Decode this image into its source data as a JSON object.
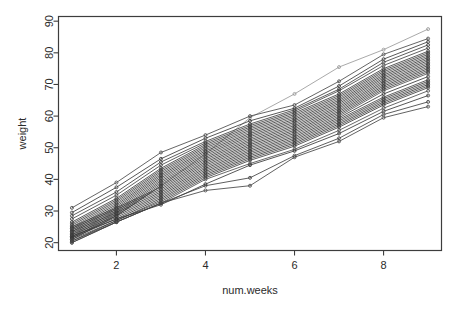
{
  "chart_data": {
    "type": "line",
    "title": "",
    "subtitle": "",
    "xlabel": "num.weeks",
    "ylabel": "weight",
    "xlim": [
      1,
      9
    ],
    "ylim": [
      19,
      90
    ],
    "xticks": [
      2,
      4,
      6,
      8
    ],
    "xticklabels": [
      "2",
      "4",
      "6",
      "8"
    ],
    "yticks": [
      20,
      30,
      40,
      50,
      60,
      70,
      80,
      90
    ],
    "yticklabels": [
      "20",
      "30",
      "40",
      "50",
      "60",
      "70",
      "80",
      "90"
    ],
    "grid": false,
    "legend": false,
    "legend_position": "none",
    "marker": "open-circle",
    "marker_size": 3,
    "line_color": "#333333",
    "background_color": "#ffffff",
    "frame_color": "#3d3d3d",
    "x": [
      1,
      2,
      3,
      4,
      5,
      6,
      7,
      8,
      9
    ],
    "n_series": 31,
    "series": [
      {
        "name": "subject-01",
        "color": "#9a9a9a",
        "values": [
          21.5,
          28.5,
          38.0,
          48.0,
          59.5,
          67.0,
          75.5,
          81.0,
          87.5
        ]
      },
      {
        "name": "subject-02",
        "color": "#4a4a4a",
        "values": [
          31.0,
          39.0,
          48.5,
          54.0,
          60.0,
          63.5,
          71.0,
          79.5,
          84.5
        ]
      },
      {
        "name": "subject-03",
        "color": "#3a3a3a",
        "values": [
          29.5,
          37.5,
          46.5,
          53.0,
          58.5,
          62.5,
          69.5,
          78.0,
          83.5
        ]
      },
      {
        "name": "subject-04",
        "color": "#404040",
        "values": [
          28.5,
          36.0,
          45.5,
          52.0,
          57.5,
          62.0,
          68.5,
          77.0,
          82.5
        ]
      },
      {
        "name": "subject-05",
        "color": "#454545",
        "values": [
          27.5,
          35.0,
          44.5,
          51.5,
          57.0,
          61.5,
          68.0,
          76.0,
          81.5
        ]
      },
      {
        "name": "subject-06",
        "color": "#3c3c3c",
        "values": [
          26.5,
          34.0,
          43.5,
          51.0,
          56.5,
          61.0,
          67.0,
          75.0,
          80.5
        ]
      },
      {
        "name": "subject-07",
        "color": "#484848",
        "values": [
          26.0,
          33.5,
          43.0,
          50.5,
          56.0,
          60.5,
          66.5,
          74.5,
          80.0
        ]
      },
      {
        "name": "subject-08",
        "color": "#3e3e3e",
        "values": [
          25.5,
          33.0,
          42.5,
          50.0,
          55.5,
          60.0,
          66.0,
          74.0,
          79.5
        ]
      },
      {
        "name": "subject-09",
        "color": "#525252",
        "values": [
          25.0,
          32.5,
          42.0,
          49.5,
          55.0,
          59.5,
          65.5,
          73.5,
          79.0
        ]
      },
      {
        "name": "subject-10",
        "color": "#383838",
        "values": [
          24.5,
          32.0,
          41.5,
          49.0,
          54.5,
          59.0,
          65.0,
          73.0,
          78.5
        ]
      },
      {
        "name": "subject-11",
        "color": "#464646",
        "values": [
          24.0,
          31.5,
          41.0,
          48.5,
          54.0,
          58.5,
          64.5,
          72.5,
          78.0
        ]
      },
      {
        "name": "subject-12",
        "color": "#3b3b3b",
        "values": [
          23.5,
          31.0,
          40.5,
          48.0,
          53.5,
          58.0,
          64.0,
          72.0,
          77.5
        ]
      },
      {
        "name": "subject-13",
        "color": "#505050",
        "values": [
          23.0,
          30.5,
          40.0,
          47.5,
          53.0,
          57.5,
          63.5,
          71.5,
          77.0
        ]
      },
      {
        "name": "subject-14",
        "color": "#404040",
        "values": [
          22.5,
          30.0,
          39.5,
          47.0,
          52.5,
          57.0,
          63.0,
          71.0,
          76.5
        ]
      },
      {
        "name": "subject-15",
        "color": "#3d3d3d",
        "values": [
          22.0,
          29.5,
          39.0,
          46.5,
          52.0,
          56.5,
          62.5,
          70.5,
          76.0
        ]
      },
      {
        "name": "subject-16",
        "color": "#4c4c4c",
        "values": [
          21.5,
          29.0,
          38.5,
          46.0,
          51.5,
          56.0,
          62.0,
          70.0,
          75.5
        ]
      },
      {
        "name": "subject-17",
        "color": "#363636",
        "values": [
          21.0,
          28.5,
          38.0,
          45.5,
          51.0,
          55.5,
          61.5,
          69.5,
          75.0
        ]
      },
      {
        "name": "subject-18",
        "color": "#444444",
        "values": [
          25.0,
          31.0,
          37.5,
          45.0,
          50.5,
          55.0,
          61.0,
          69.0,
          74.5
        ]
      },
      {
        "name": "subject-19",
        "color": "#3f3f3f",
        "values": [
          24.5,
          30.5,
          37.0,
          44.5,
          50.0,
          54.5,
          60.5,
          68.5,
          74.0
        ]
      },
      {
        "name": "subject-20",
        "color": "#4e4e4e",
        "values": [
          24.0,
          30.0,
          36.5,
          44.0,
          49.5,
          54.0,
          60.0,
          68.0,
          73.5
        ]
      },
      {
        "name": "subject-21",
        "color": "#373737",
        "values": [
          23.5,
          29.5,
          36.0,
          43.5,
          49.0,
          53.5,
          59.5,
          67.0,
          72.5
        ]
      },
      {
        "name": "subject-22",
        "color": "#474747",
        "values": [
          23.0,
          29.0,
          35.5,
          43.0,
          48.5,
          53.0,
          59.0,
          66.0,
          71.5
        ]
      },
      {
        "name": "subject-23",
        "color": "#3a3a3a",
        "values": [
          22.5,
          28.5,
          35.0,
          42.5,
          48.0,
          52.5,
          58.5,
          65.5,
          71.0
        ]
      },
      {
        "name": "subject-24",
        "color": "#4a4a4a",
        "values": [
          22.0,
          28.0,
          34.5,
          42.0,
          47.5,
          52.0,
          58.0,
          65.0,
          70.5
        ]
      },
      {
        "name": "subject-25",
        "color": "#353535",
        "values": [
          21.5,
          27.5,
          34.0,
          41.5,
          47.0,
          51.5,
          57.5,
          64.5,
          70.0
        ]
      },
      {
        "name": "subject-26",
        "color": "#434343",
        "values": [
          21.0,
          27.0,
          33.5,
          41.0,
          46.5,
          51.0,
          57.0,
          64.0,
          69.5
        ]
      },
      {
        "name": "subject-27",
        "color": "#3e3e3e",
        "values": [
          20.5,
          27.0,
          33.0,
          40.5,
          46.0,
          50.5,
          56.5,
          63.5,
          69.0
        ]
      },
      {
        "name": "subject-28",
        "color": "#4d4d4d",
        "values": [
          20.0,
          26.5,
          32.5,
          40.0,
          45.0,
          49.5,
          55.5,
          62.5,
          68.0
        ]
      },
      {
        "name": "subject-29",
        "color": "#393939",
        "values": [
          22.0,
          27.5,
          32.0,
          38.5,
          44.5,
          49.0,
          54.5,
          61.5,
          66.5
        ]
      },
      {
        "name": "subject-30",
        "color": "#414141",
        "values": [
          20.5,
          26.5,
          32.5,
          38.0,
          40.5,
          47.5,
          53.0,
          60.5,
          64.5
        ]
      },
      {
        "name": "subject-31",
        "color": "#464646",
        "values": [
          20.0,
          26.5,
          32.5,
          36.5,
          38.0,
          47.0,
          52.0,
          59.5,
          63.0
        ]
      }
    ]
  }
}
